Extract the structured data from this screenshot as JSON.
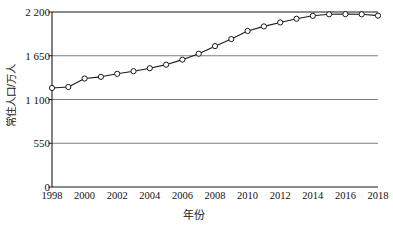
{
  "chart_data": {
    "type": "line",
    "title": "",
    "xlabel": "年份",
    "ylabel": "常住人口/万人",
    "x": [
      1998,
      1999,
      2000,
      2001,
      2002,
      2003,
      2004,
      2005,
      2006,
      2007,
      2008,
      2009,
      2010,
      2011,
      2012,
      2013,
      2014,
      2015,
      2016,
      2017,
      2018
    ],
    "values": [
      1245,
      1257,
      1364,
      1385,
      1423,
      1456,
      1493,
      1538,
      1601,
      1676,
      1771,
      1860,
      1962,
      2019,
      2069,
      2115,
      2152,
      2171,
      2173,
      2171,
      2154
    ],
    "series": [
      {
        "name": "常住人口",
        "values": [
          1245,
          1257,
          1364,
          1385,
          1423,
          1456,
          1493,
          1538,
          1601,
          1676,
          1771,
          1860,
          1962,
          2019,
          2069,
          2115,
          2152,
          2171,
          2173,
          2171,
          2154
        ]
      }
    ],
    "xlim": [
      1998,
      2018
    ],
    "ylim": [
      0,
      2200
    ],
    "yticks": [
      0,
      550,
      1100,
      1650,
      2200
    ],
    "ytick_labels": [
      "0",
      "550",
      "1 100",
      "1 650",
      "2 200"
    ],
    "xticks": [
      1998,
      2000,
      2002,
      2004,
      2006,
      2008,
      2010,
      2012,
      2014,
      2016,
      2018
    ],
    "xtick_labels": [
      "1998",
      "2000",
      "2002",
      "2004",
      "2006",
      "2008",
      "2010",
      "2012",
      "2014",
      "2016",
      "2018"
    ],
    "grid": true,
    "grid_axis": "y",
    "legend": false,
    "marker": "open-circle",
    "line_color": "#1a1a1a",
    "marker_fill": "#ffffff",
    "grid_color": "#6e6e6e",
    "axis_color": "#1a1a1a",
    "background": "#ffffff"
  }
}
